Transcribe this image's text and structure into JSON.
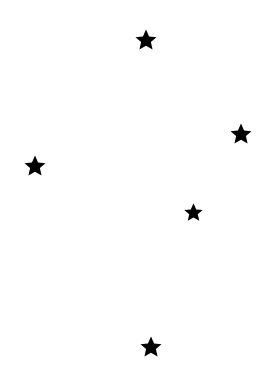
{
  "canvas": {
    "width": 268,
    "height": 368,
    "background": "#ffffff"
  },
  "stars": [
    {
      "icon": "star-icon",
      "cx": 146,
      "cy": 40,
      "size": 24,
      "color": "#000000"
    },
    {
      "icon": "star-icon",
      "cx": 241,
      "cy": 134,
      "size": 24,
      "color": "#000000"
    },
    {
      "icon": "star-icon",
      "cx": 35,
      "cy": 166,
      "size": 24,
      "color": "#000000"
    },
    {
      "icon": "star-icon",
      "cx": 193,
      "cy": 212,
      "size": 21,
      "color": "#000000"
    },
    {
      "icon": "star-icon",
      "cx": 151,
      "cy": 347,
      "size": 24,
      "color": "#000000"
    }
  ]
}
